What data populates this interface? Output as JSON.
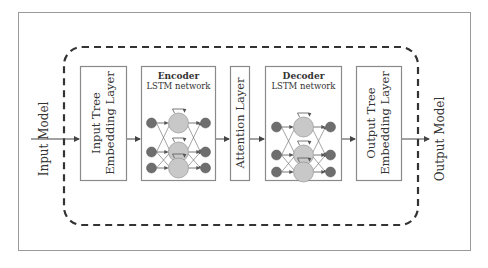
{
  "diagram": {
    "input_label": "Input Model",
    "output_label": "Output Model",
    "boxes": [
      {
        "id": "input-tree-embedding",
        "line1": "Input Tree",
        "line2": "Embedding Layer"
      },
      {
        "id": "encoder",
        "title": "Encoder",
        "subtitle": "LSTM network"
      },
      {
        "id": "attention",
        "line1": "Attention Layer"
      },
      {
        "id": "decoder",
        "title": "Decoder",
        "subtitle": "LSTM network"
      },
      {
        "id": "output-tree-embedding",
        "line1": "Output Tree",
        "line2": "Embedding Layer"
      }
    ],
    "flow": [
      "Input Model",
      "Input Tree Embedding Layer",
      "Encoder",
      "Attention Layer",
      "Decoder",
      "Output Tree Embedding Layer",
      "Output Model"
    ],
    "colors": {
      "box_border": "#8a8a8a",
      "dashed_border": "#333333",
      "outer_border": "#9a9a9a",
      "node_dark": "#6e6e6e",
      "node_light": "#c8c8c8",
      "arrow": "#444444",
      "text": "#333333"
    }
  }
}
